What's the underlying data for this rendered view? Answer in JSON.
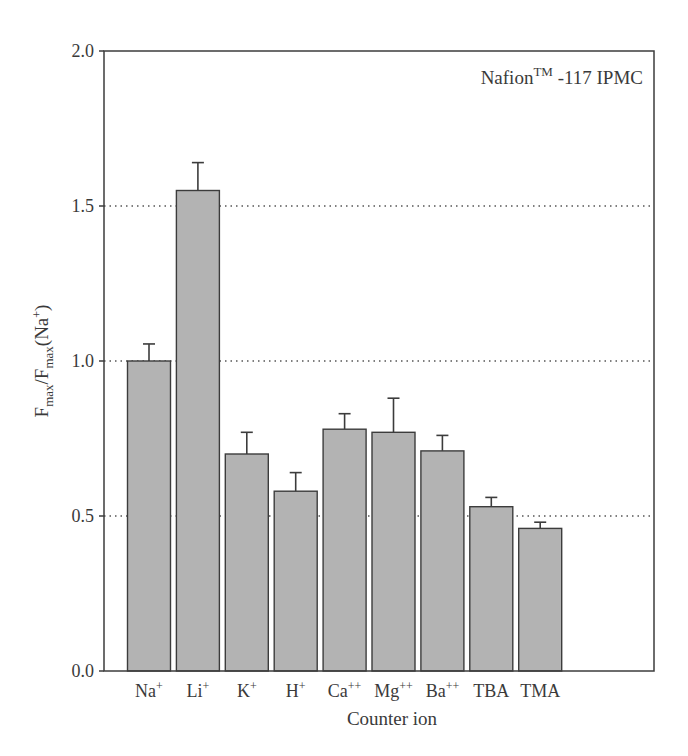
{
  "chart_data": {
    "type": "bar",
    "title": "",
    "annotation": {
      "text": "Nafion",
      "superscript": "TM",
      "suffix": " -117 IPMC"
    },
    "xlabel": "Counter ion",
    "ylabel": {
      "main": "F",
      "sub1": "max",
      "mid": "/F",
      "sub2": "max",
      "tail": "(Na",
      "sup": "+",
      "end": ")"
    },
    "ylim": [
      0.0,
      2.0
    ],
    "yticks": [
      0.0,
      0.5,
      1.0,
      1.5,
      2.0
    ],
    "ytick_labels": [
      "0.0",
      "0.5",
      "1.0",
      "1.5",
      "2.0"
    ],
    "grid": {
      "y": true,
      "style": "dotted",
      "values": [
        0.5,
        1.0,
        1.5
      ]
    },
    "legend": null,
    "categories": [
      {
        "base": "Na",
        "sup": "+"
      },
      {
        "base": "Li",
        "sup": "+"
      },
      {
        "base": "K",
        "sup": "+"
      },
      {
        "base": "H",
        "sup": "+"
      },
      {
        "base": "Ca",
        "sup": "++"
      },
      {
        "base": "Mg",
        "sup": "++"
      },
      {
        "base": "Ba",
        "sup": "++"
      },
      {
        "base": "TBA",
        "sup": ""
      },
      {
        "base": "TMA",
        "sup": ""
      }
    ],
    "category_labels": [
      "Na+",
      "Li+",
      "K+",
      "H+",
      "Ca++",
      "Mg++",
      "Ba++",
      "TBA",
      "TMA"
    ],
    "values": [
      1.0,
      1.55,
      0.7,
      0.58,
      0.78,
      0.77,
      0.71,
      0.53,
      0.46
    ],
    "error_upper": [
      0.055,
      0.09,
      0.07,
      0.06,
      0.05,
      0.11,
      0.05,
      0.03,
      0.02
    ],
    "colors": {
      "bar_fill": "#b3b3b3",
      "bar_stroke": "#3c3c3c",
      "axis": "#3c3c3c",
      "grid": "#555555"
    }
  }
}
